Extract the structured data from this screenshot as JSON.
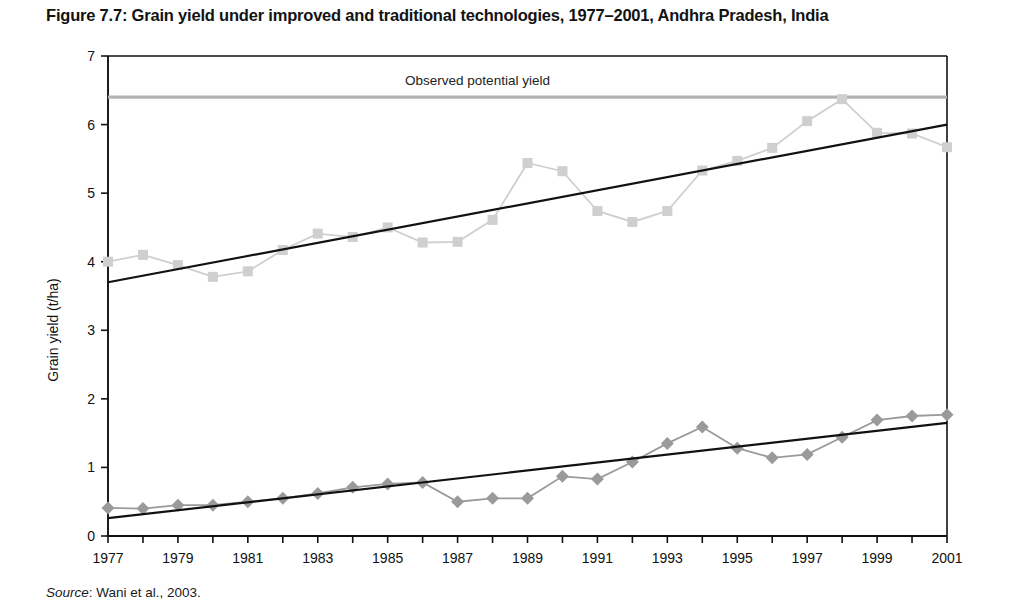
{
  "figure": {
    "title": "Figure 7.7: Grain yield under improved and traditional technologies, 1977–2001, Andhra Pradesh, India",
    "source_label": "Source",
    "source_text": ": Wani et al., 2003."
  },
  "colors": {
    "improved_series": "#cfcfcf",
    "traditional_series": "#9a9a9a",
    "trend_line": "#111111",
    "potential_line": "#b3b3b3",
    "axis": "#111111",
    "text": "#131313"
  },
  "chart_data": {
    "type": "line",
    "title": "Figure 7.7: Grain yield under improved and traditional technologies, 1977–2001, Andhra Pradesh, India",
    "xlabel": "",
    "ylabel": "Grain yield  (t/ha)",
    "xlim": [
      1977,
      2001
    ],
    "ylim": [
      0,
      7
    ],
    "yticks": [
      0,
      1,
      2,
      3,
      4,
      5,
      6,
      7
    ],
    "ytick_labels": [
      "0",
      "1",
      "2",
      "3",
      "4",
      "5",
      "6",
      "7"
    ],
    "xticks": [
      1977,
      1978,
      1979,
      1980,
      1981,
      1982,
      1983,
      1984,
      1985,
      1986,
      1987,
      1988,
      1989,
      1990,
      1991,
      1992,
      1993,
      1994,
      1995,
      1996,
      1997,
      1998,
      1999,
      2000,
      2001
    ],
    "xtick_labels": [
      "1977",
      "",
      "1979",
      "",
      "1981",
      "",
      "1983",
      "",
      "1985",
      "",
      "1987",
      "",
      "1989",
      "",
      "1991",
      "",
      "1993",
      "",
      "1995",
      "",
      "1997",
      "",
      "1999",
      "",
      "2001"
    ],
    "grid": false,
    "legend": "none",
    "x": [
      1977,
      1978,
      1979,
      1980,
      1981,
      1982,
      1983,
      1984,
      1985,
      1986,
      1987,
      1988,
      1989,
      1990,
      1991,
      1992,
      1993,
      1994,
      1995,
      1996,
      1997,
      1998,
      1999,
      2000,
      2001
    ],
    "series": [
      {
        "name": "Improved technology",
        "marker": "square",
        "color": "#cfcfcf",
        "values": [
          4.0,
          4.1,
          3.95,
          3.78,
          3.86,
          4.17,
          4.41,
          4.36,
          4.5,
          4.28,
          4.29,
          4.61,
          5.44,
          5.32,
          4.74,
          4.58,
          4.74,
          5.33,
          5.47,
          5.66,
          6.05,
          6.37,
          5.88,
          5.87,
          5.67
        ]
      },
      {
        "name": "Traditional technology",
        "marker": "diamond",
        "color": "#9a9a9a",
        "values": [
          0.41,
          0.4,
          0.45,
          0.45,
          0.5,
          0.55,
          0.62,
          0.71,
          0.76,
          0.78,
          0.5,
          0.55,
          0.55,
          0.87,
          0.83,
          1.08,
          1.35,
          1.59,
          1.28,
          1.14,
          1.19,
          1.44,
          1.69,
          1.75,
          1.77
        ]
      }
    ],
    "trend_lines": [
      {
        "name": "Improved technology trend",
        "x": [
          1977,
          2001
        ],
        "values": [
          3.7,
          6.0
        ],
        "color": "#111111"
      },
      {
        "name": "Traditional technology trend",
        "x": [
          1977,
          2001
        ],
        "values": [
          0.26,
          1.65
        ],
        "color": "#111111"
      }
    ],
    "reference_lines": [
      {
        "name": "Observed potential yield",
        "label": "Observed potential yield",
        "value": 6.4,
        "orientation": "horizontal",
        "color": "#b3b3b3"
      }
    ]
  }
}
